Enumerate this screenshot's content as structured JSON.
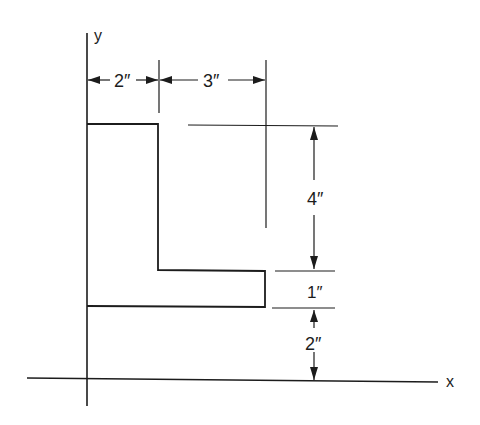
{
  "figure": {
    "type": "L-shaped cross-section with dimensions",
    "axes": {
      "x_label": "x",
      "y_label": "y"
    },
    "dimensions": {
      "flange_width": "2″",
      "leg_extension": "3″",
      "vertical_upper": "4″",
      "leg_thickness": "1″",
      "offset_from_x_axis": "2″"
    },
    "colors": {
      "ink": "#1c1c1c",
      "background": "#ffffff"
    }
  }
}
